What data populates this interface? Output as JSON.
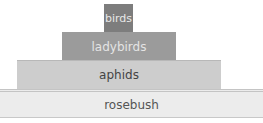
{
  "diagram": {
    "tiers": [
      {
        "label": "birds",
        "color": "#7d7d7d"
      },
      {
        "label": "ladybirds",
        "color": "#9b9b9b"
      },
      {
        "label": "aphids",
        "color": "#cdcdcd"
      },
      {
        "label": "rosebush",
        "color": "#ececec"
      }
    ]
  }
}
